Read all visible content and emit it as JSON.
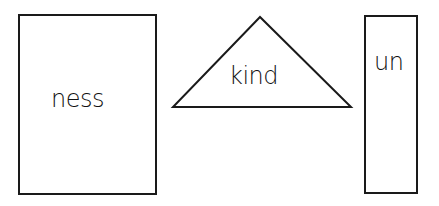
{
  "shapes": [
    {
      "type": "rectangle",
      "label": "ness"
    },
    {
      "type": "triangle",
      "label": "kind"
    },
    {
      "type": "rectangle",
      "label": "un"
    }
  ],
  "colors": {
    "stroke": "#1a1a1a",
    "background": "#ffffff"
  }
}
